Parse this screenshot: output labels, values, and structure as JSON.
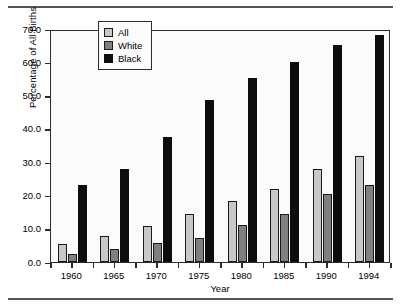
{
  "chart_data": {
    "type": "bar",
    "title": "",
    "xlabel": "Year",
    "ylabel": "Percentage of All Births",
    "categories": [
      "1960",
      "1965",
      "1970",
      "1975",
      "1980",
      "1985",
      "1990",
      "1994"
    ],
    "series": [
      {
        "name": "All",
        "color": "#c8c8c8",
        "values": [
          5.3,
          7.7,
          10.7,
          14.3,
          18.4,
          22.0,
          28.0,
          32.0
        ]
      },
      {
        "name": "White",
        "color": "#808080",
        "values": [
          2.3,
          4.0,
          5.7,
          7.3,
          11.0,
          14.5,
          20.4,
          23.0
        ]
      },
      {
        "name": "Black",
        "color": "#0d0d0d",
        "values": [
          23.0,
          28.0,
          37.6,
          48.8,
          55.2,
          60.1,
          65.2,
          68.2
        ]
      }
    ],
    "ylim": [
      0.0,
      70.0
    ],
    "ytick_labels": [
      "0.0",
      "10.0",
      "20.0",
      "30.0",
      "40.0",
      "50.0",
      "60.0",
      "70.0"
    ],
    "ytick_values": [
      0.0,
      10.0,
      20.0,
      30.0,
      40.0,
      50.0,
      60.0,
      70.0
    ],
    "grid": false,
    "legend_position": "top-left-inside"
  },
  "legend": {
    "items": [
      {
        "label": "All",
        "swatch": "all"
      },
      {
        "label": "White",
        "swatch": "white"
      },
      {
        "label": "Black",
        "swatch": "black"
      }
    ]
  },
  "colors": {
    "all": "#c8c8c8",
    "white": "#808080",
    "black": "#0d0d0d",
    "axis": "#2b2b2b",
    "rule": "#555555",
    "plot_background": "#fbfbfb"
  }
}
